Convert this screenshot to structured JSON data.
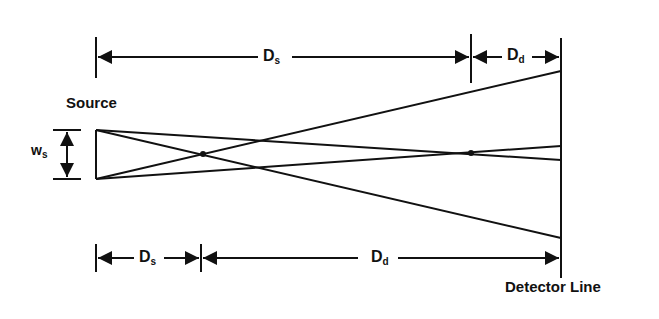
{
  "diagram": {
    "labels": {
      "source": "Source",
      "detector": "Detector Line",
      "width_main": "w",
      "width_sub": "s",
      "top_left_main": "D",
      "top_left_sub": "s",
      "top_right_main": "D",
      "top_right_sub": "d",
      "bottom_left_main": "D",
      "bottom_left_sub": "s",
      "bottom_right_main": "D",
      "bottom_right_sub": "d"
    },
    "colors": {
      "line": "#111111",
      "background": "#ffffff"
    }
  }
}
